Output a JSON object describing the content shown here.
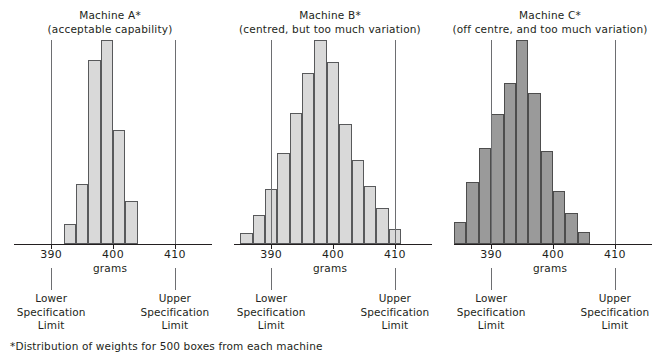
{
  "footnote": "*Distribution of weights for 500 boxes from each machine",
  "axis": {
    "name": "grams",
    "ticks": [
      390,
      400,
      410
    ],
    "lower_spec_label": [
      "Lower",
      "Specification",
      "Limit"
    ],
    "upper_spec_label": [
      "Upper",
      "Specification",
      "Limit"
    ]
  },
  "colors": {
    "bar_light": "#d9d9d9",
    "bar_dark": "#9a9a9a",
    "bar_stroke": "#58595b",
    "spec_line": "#6d6e71",
    "axis": "#231f20"
  },
  "chart_data": [
    {
      "type": "bar",
      "title": "Machine A*",
      "subtitle": "(acceptable capability)",
      "xlabel": "grams",
      "ylabel": "",
      "xlim": [
        384,
        416
      ],
      "xticks": [
        390,
        400,
        410
      ],
      "grid": false,
      "legend": "none",
      "fill": "#d9d9d9",
      "lower_spec_limit": 390,
      "upper_spec_limit": 410,
      "bin_width": 2,
      "categories": [
        393,
        395,
        397,
        399,
        401,
        403
      ],
      "values": [
        12,
        36,
        110,
        122,
        68,
        26
      ],
      "annotations": [
        "Lower Specification Limit",
        "Upper Specification Limit"
      ]
    },
    {
      "type": "bar",
      "title": "Machine B*",
      "subtitle": "(centred, but too much variation)",
      "xlabel": "grams",
      "ylabel": "",
      "xlim": [
        384,
        416
      ],
      "xticks": [
        390,
        400,
        410
      ],
      "grid": false,
      "legend": "none",
      "fill": "#d9d9d9",
      "lower_spec_limit": 390,
      "upper_spec_limit": 410,
      "bin_width": 2,
      "categories": [
        386,
        388,
        390,
        392,
        394,
        396,
        398,
        400,
        402,
        404,
        406,
        408,
        410
      ],
      "values": [
        6,
        16,
        30,
        50,
        72,
        94,
        112,
        100,
        66,
        46,
        32,
        20,
        8
      ],
      "annotations": [
        "Lower Specification Limit",
        "Upper Specification Limit"
      ]
    },
    {
      "type": "bar",
      "title": "Machine C*",
      "subtitle": "(off centre, and too much variation)",
      "xlabel": "grams",
      "ylabel": "",
      "xlim": [
        384,
        416
      ],
      "xticks": [
        390,
        400,
        410
      ],
      "grid": false,
      "legend": "none",
      "fill": "#9a9a9a",
      "lower_spec_limit": 390,
      "upper_spec_limit": 410,
      "bin_width": 2,
      "categories": [
        385,
        387,
        389,
        391,
        393,
        395,
        397,
        399,
        401,
        403,
        405
      ],
      "values": [
        14,
        40,
        62,
        84,
        104,
        132,
        98,
        60,
        34,
        20,
        8
      ],
      "annotations": [
        "Lower Specification Limit",
        "Upper Specification Limit"
      ]
    }
  ]
}
